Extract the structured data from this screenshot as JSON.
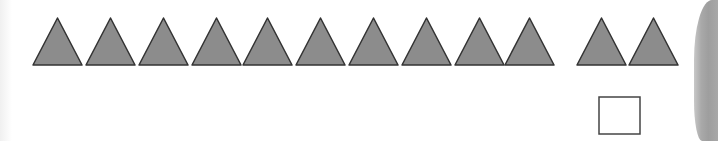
{
  "worksheet": {
    "triangle_count": 12,
    "group_1_count": 10,
    "group_2_count": 2,
    "triangle_fill": "#8c8c8c",
    "triangle_stroke": "#333333",
    "answer_box": {
      "value": ""
    },
    "page_curl_color": "#a6a6a6"
  }
}
